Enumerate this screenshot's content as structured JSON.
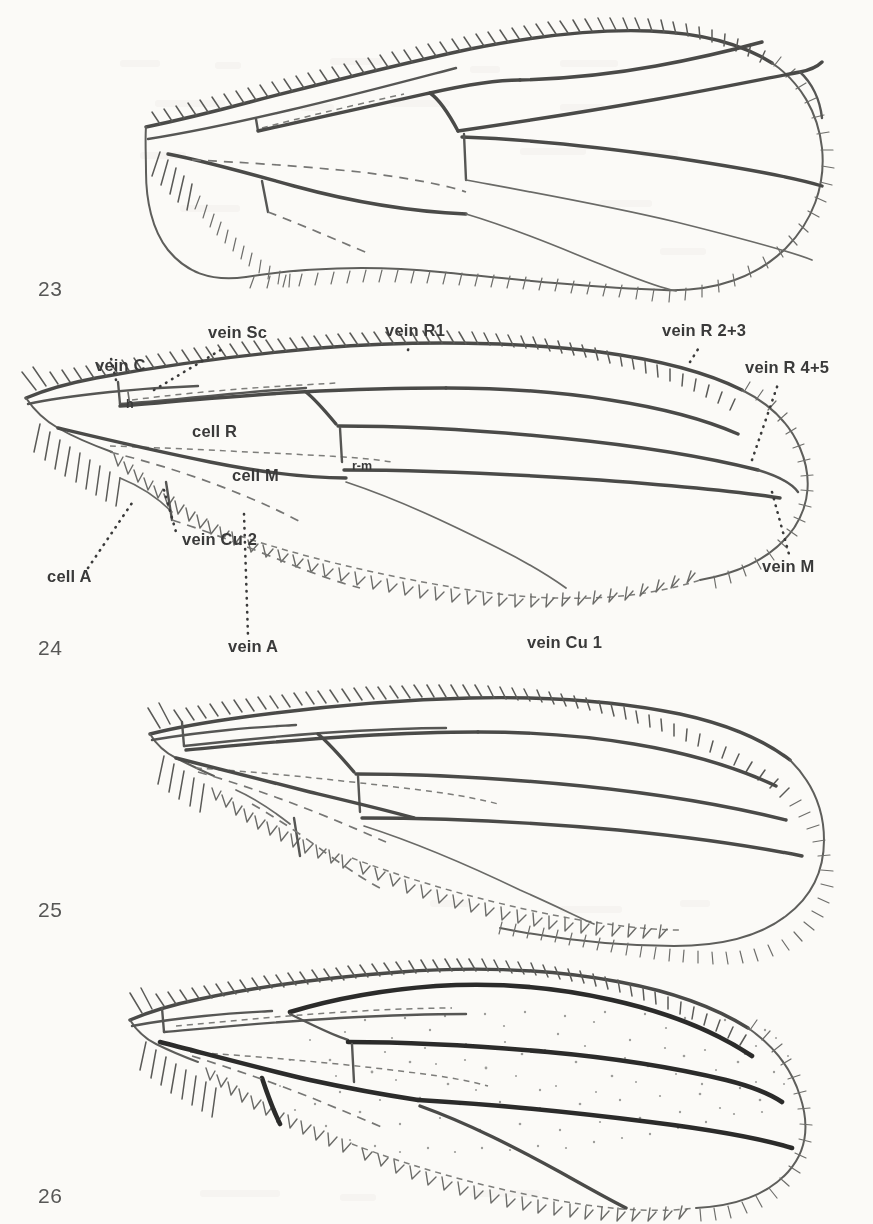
{
  "plate": {
    "title": "Wing venation plate (Figures 23-26)",
    "background_color": "#fbfaf7",
    "ink_color": "#3a3a3a"
  },
  "figures": [
    {
      "number": "23",
      "number_x": 38,
      "number_y": 296,
      "caption": "wing, unlabelled, figure 23"
    },
    {
      "number": "24",
      "number_x": 38,
      "number_y": 655,
      "caption": "wing with vein and cell labels, figure 24"
    },
    {
      "number": "25",
      "number_x": 38,
      "number_y": 917,
      "caption": "wing, unlabelled, figure 25"
    },
    {
      "number": "26",
      "number_x": 38,
      "number_y": 1203,
      "caption": "wing with infuscation, figure 26"
    }
  ],
  "labels": [
    {
      "id": "vein-c",
      "text": "vein C",
      "x": 95,
      "y": 371,
      "anchor": "start"
    },
    {
      "id": "vein-sc",
      "text": "vein Sc",
      "x": 208,
      "y": 338,
      "anchor": "start"
    },
    {
      "id": "vein-r1",
      "text": "vein R1",
      "x": 385,
      "y": 336,
      "anchor": "start"
    },
    {
      "id": "vein-r23",
      "text": "vein R 2+3",
      "x": 662,
      "y": 336,
      "anchor": "start"
    },
    {
      "id": "vein-r45",
      "text": "vein R 4+5",
      "x": 745,
      "y": 373,
      "anchor": "start"
    },
    {
      "id": "vein-m",
      "text": "vein M",
      "x": 762,
      "y": 572,
      "anchor": "start"
    },
    {
      "id": "vein-cu1",
      "text": "vein Cu 1",
      "x": 527,
      "y": 648,
      "anchor": "start"
    },
    {
      "id": "vein-cu2",
      "text": "vein Cu 2",
      "x": 182,
      "y": 545,
      "anchor": "start"
    },
    {
      "id": "vein-a",
      "text": "vein A",
      "x": 228,
      "y": 652,
      "anchor": "start"
    },
    {
      "id": "cell-a",
      "text": "cell A",
      "x": 47,
      "y": 582,
      "anchor": "start"
    },
    {
      "id": "cell-r",
      "text": "cell R",
      "x": 192,
      "y": 437,
      "anchor": "start"
    },
    {
      "id": "cell-m",
      "text": "cell M",
      "x": 232,
      "y": 481,
      "anchor": "start"
    },
    {
      "id": "crossvein-h",
      "text": "h",
      "x": 126,
      "y": 408,
      "anchor": "start",
      "small": true
    },
    {
      "id": "crossvein-rm",
      "text": "r-m",
      "x": 352,
      "y": 470,
      "anchor": "start",
      "small": true
    }
  ]
}
